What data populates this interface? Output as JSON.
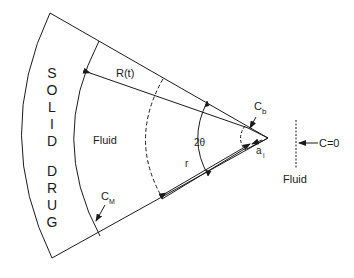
{
  "diagram": {
    "title": "",
    "regions": {
      "solid_drug_letters": [
        "S",
        "O",
        "L",
        "I",
        "D",
        "D",
        "R",
        "U",
        "G"
      ],
      "solid_word": "SOLID",
      "drug_word": "DRUG",
      "fluid_inner": "Fluid",
      "fluid_outer": "Fluid"
    },
    "labels": {
      "radius_t": "R(t)",
      "angle": "2θ",
      "radius": "r",
      "c_b": "C",
      "c_b_sub": "b",
      "c_m": "C",
      "c_m_sub": "M",
      "a_i": "a",
      "a_i_sub": "i",
      "c_zero": "C=0"
    },
    "colors": {
      "stroke": "#1a1a1a",
      "background": "#ffffff"
    }
  }
}
